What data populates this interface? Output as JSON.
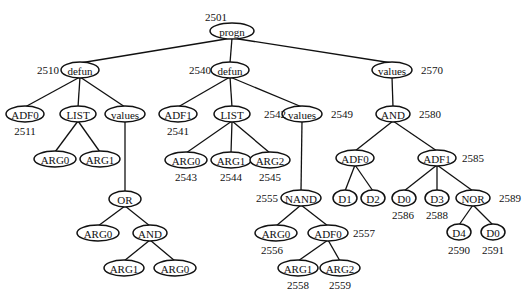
{
  "diagram": {
    "type": "tree",
    "nodes": [
      {
        "id": "n_progn",
        "label": "progn",
        "number": "2501",
        "parent": null
      },
      {
        "id": "n_defun1",
        "label": "defun",
        "number": "2510",
        "parent": "n_progn"
      },
      {
        "id": "n_defun2",
        "label": "defun",
        "number": "2540",
        "parent": "n_progn"
      },
      {
        "id": "n_values3",
        "label": "values",
        "number": "2570",
        "parent": "n_progn"
      },
      {
        "id": "n_adf0_a",
        "label": "ADF0",
        "number": "2511",
        "parent": "n_defun1"
      },
      {
        "id": "n_list_a",
        "label": "LIST",
        "number": "",
        "parent": "n_defun1"
      },
      {
        "id": "n_values_a",
        "label": "values",
        "number": "",
        "parent": "n_defun1"
      },
      {
        "id": "n_arg0_a",
        "label": "ARG0",
        "number": "",
        "parent": "n_list_a"
      },
      {
        "id": "n_arg1_a",
        "label": "ARG1",
        "number": "",
        "parent": "n_list_a"
      },
      {
        "id": "n_or",
        "label": "OR",
        "number": "",
        "parent": "n_values_a"
      },
      {
        "id": "n_arg0_or",
        "label": "ARG0",
        "number": "",
        "parent": "n_or"
      },
      {
        "id": "n_and_or",
        "label": "AND",
        "number": "",
        "parent": "n_or"
      },
      {
        "id": "n_arg1_and",
        "label": "ARG1",
        "number": "",
        "parent": "n_and_or"
      },
      {
        "id": "n_arg0_and",
        "label": "ARG0",
        "number": "",
        "parent": "n_and_or"
      },
      {
        "id": "n_adf1_b",
        "label": "ADF1",
        "number": "2541",
        "parent": "n_defun2"
      },
      {
        "id": "n_list_b",
        "label": "LIST",
        "number": "2542",
        "parent": "n_defun2"
      },
      {
        "id": "n_values_b",
        "label": "values",
        "number": "2549",
        "parent": "n_defun2"
      },
      {
        "id": "n_arg0_b",
        "label": "ARG0",
        "number": "2543",
        "parent": "n_list_b"
      },
      {
        "id": "n_arg1_b",
        "label": "ARG1",
        "number": "2544",
        "parent": "n_list_b"
      },
      {
        "id": "n_arg2_b",
        "label": "ARG2",
        "number": "2545",
        "parent": "n_list_b"
      },
      {
        "id": "n_nand",
        "label": "NAND",
        "number": "2555",
        "parent": "n_values_b"
      },
      {
        "id": "n_arg0_nand",
        "label": "ARG0",
        "number": "2556",
        "parent": "n_nand"
      },
      {
        "id": "n_adf0_nand",
        "label": "ADF0",
        "number": "2557",
        "parent": "n_nand"
      },
      {
        "id": "n_arg1_adf0",
        "label": "ARG1",
        "number": "2558",
        "parent": "n_adf0_nand"
      },
      {
        "id": "n_arg2_adf0",
        "label": "ARG2",
        "number": "2559",
        "parent": "n_adf0_nand"
      },
      {
        "id": "n_and_c",
        "label": "AND",
        "number": "2580",
        "parent": "n_values3"
      },
      {
        "id": "n_adf0_c",
        "label": "ADF0",
        "number": "",
        "parent": "n_and_c"
      },
      {
        "id": "n_adf1_c",
        "label": "ADF1",
        "number": "2585",
        "parent": "n_and_c"
      },
      {
        "id": "n_d1",
        "label": "D1",
        "number": "",
        "parent": "n_adf0_c"
      },
      {
        "id": "n_d2",
        "label": "D2",
        "number": "",
        "parent": "n_adf0_c"
      },
      {
        "id": "n_d0_c",
        "label": "D0",
        "number": "2586",
        "parent": "n_adf1_c"
      },
      {
        "id": "n_d3",
        "label": "D3",
        "number": "2588",
        "parent": "n_adf1_c"
      },
      {
        "id": "n_nor",
        "label": "NOR",
        "number": "2589",
        "parent": "n_adf1_c"
      },
      {
        "id": "n_d4",
        "label": "D4",
        "number": "2590",
        "parent": "n_nor"
      },
      {
        "id": "n_d0_nor",
        "label": "D0",
        "number": "2591",
        "parent": "n_nor"
      }
    ]
  }
}
